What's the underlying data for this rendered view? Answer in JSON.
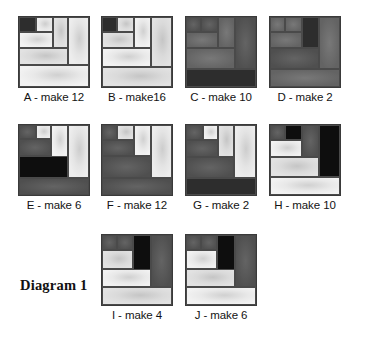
{
  "figure": {
    "title": "Diagram 1",
    "type": "quilt-block-diagram",
    "block_count": 10
  },
  "palette": {
    "very_dark": "#2d2d2d",
    "black": "#0e0e0e",
    "dark_gray": "#585858",
    "medium_gray": "#6e6e6e",
    "light_gray": "#e2e2e2",
    "pale_gray": "#ededed",
    "white_gray": "#f2f2f2",
    "outline": "#3a3a3a"
  },
  "blocks": [
    {
      "id": "A",
      "label": "A - make 12",
      "letter": "A",
      "make": 12,
      "patches": [
        {
          "name": "top-left-square",
          "x": 0,
          "y": 0,
          "w": 24,
          "h": 22,
          "tone": "very_dark"
        },
        {
          "name": "top-mid-square",
          "x": 24,
          "y": 0,
          "w": 24,
          "h": 22,
          "tone": "pale_gray"
        },
        {
          "name": "upper-mid-left-rect",
          "x": 0,
          "y": 22,
          "w": 48,
          "h": 22,
          "tone": "white_gray"
        },
        {
          "name": "tall-center-strip",
          "x": 48,
          "y": 0,
          "w": 22,
          "h": 44,
          "tone": "light_gray"
        },
        {
          "name": "right-tall-strip",
          "x": 70,
          "y": 0,
          "w": 30,
          "h": 68,
          "tone": "pale_gray"
        },
        {
          "name": "mid-wide-bar",
          "x": 0,
          "y": 44,
          "w": 70,
          "h": 24,
          "tone": "light_gray"
        },
        {
          "name": "bottom-full-bar",
          "x": 0,
          "y": 68,
          "w": 100,
          "h": 32,
          "tone": "white_gray"
        }
      ]
    },
    {
      "id": "B",
      "label": "B - make16",
      "letter": "B",
      "make": 16,
      "patches": [
        {
          "name": "top-left-square",
          "x": 0,
          "y": 0,
          "w": 22,
          "h": 22,
          "tone": "very_dark"
        },
        {
          "name": "top-mid-square",
          "x": 22,
          "y": 0,
          "w": 24,
          "h": 22,
          "tone": "light_gray"
        },
        {
          "name": "upper-left-bar",
          "x": 0,
          "y": 22,
          "w": 46,
          "h": 22,
          "tone": "light_gray"
        },
        {
          "name": "center-strip",
          "x": 46,
          "y": 0,
          "w": 24,
          "h": 44,
          "tone": "white_gray"
        },
        {
          "name": "right-tall-strip",
          "x": 70,
          "y": 0,
          "w": 30,
          "h": 72,
          "tone": "light_gray"
        },
        {
          "name": "mid-wide-bar",
          "x": 0,
          "y": 44,
          "w": 70,
          "h": 28,
          "tone": "white_gray"
        },
        {
          "name": "bottom-full-bar",
          "x": 0,
          "y": 72,
          "w": 100,
          "h": 28,
          "tone": "light_gray"
        }
      ]
    },
    {
      "id": "C",
      "label": "C - make 10",
      "letter": "C",
      "make": 10,
      "patches": [
        {
          "name": "top-left-square",
          "x": 0,
          "y": 0,
          "w": 22,
          "h": 22,
          "tone": "dark_gray"
        },
        {
          "name": "top-mid-square",
          "x": 22,
          "y": 0,
          "w": 24,
          "h": 22,
          "tone": "dark_gray"
        },
        {
          "name": "upper-left-bar",
          "x": 0,
          "y": 22,
          "w": 46,
          "h": 22,
          "tone": "medium_gray"
        },
        {
          "name": "center-strip",
          "x": 46,
          "y": 0,
          "w": 24,
          "h": 44,
          "tone": "medium_gray"
        },
        {
          "name": "right-tall-strip",
          "x": 70,
          "y": 0,
          "w": 30,
          "h": 74,
          "tone": "dark_gray"
        },
        {
          "name": "mid-wide-bar",
          "x": 0,
          "y": 44,
          "w": 70,
          "h": 30,
          "tone": "medium_gray"
        },
        {
          "name": "bottom-full-bar",
          "x": 0,
          "y": 74,
          "w": 100,
          "h": 26,
          "tone": "very_dark"
        }
      ]
    },
    {
      "id": "D",
      "label": "D - make 2",
      "letter": "D",
      "make": 2,
      "patches": [
        {
          "name": "top-left-square",
          "x": 0,
          "y": 0,
          "w": 22,
          "h": 22,
          "tone": "medium_gray"
        },
        {
          "name": "top-mid-square",
          "x": 22,
          "y": 0,
          "w": 24,
          "h": 22,
          "tone": "medium_gray"
        },
        {
          "name": "upper-left-bar",
          "x": 0,
          "y": 22,
          "w": 46,
          "h": 22,
          "tone": "medium_gray"
        },
        {
          "name": "center-dark-strip",
          "x": 46,
          "y": 0,
          "w": 24,
          "h": 44,
          "tone": "very_dark"
        },
        {
          "name": "right-tall-strip",
          "x": 70,
          "y": 0,
          "w": 30,
          "h": 74,
          "tone": "medium_gray"
        },
        {
          "name": "mid-wide-bar",
          "x": 0,
          "y": 44,
          "w": 70,
          "h": 30,
          "tone": "dark_gray"
        },
        {
          "name": "bottom-full-bar",
          "x": 0,
          "y": 74,
          "w": 100,
          "h": 26,
          "tone": "medium_gray"
        }
      ]
    },
    {
      "id": "E",
      "label": "E - make 6",
      "letter": "E",
      "make": 6,
      "patches": [
        {
          "name": "top-left-square",
          "x": 0,
          "y": 0,
          "w": 24,
          "h": 20,
          "tone": "dark_gray"
        },
        {
          "name": "top-mid-square",
          "x": 24,
          "y": 0,
          "w": 22,
          "h": 20,
          "tone": "pale_gray"
        },
        {
          "name": "upper-left-bar",
          "x": 0,
          "y": 20,
          "w": 46,
          "h": 24,
          "tone": "dark_gray"
        },
        {
          "name": "center-light-strip",
          "x": 46,
          "y": 0,
          "w": 24,
          "h": 46,
          "tone": "white_gray"
        },
        {
          "name": "right-tall-strip",
          "x": 70,
          "y": 0,
          "w": 30,
          "h": 76,
          "tone": "pale_gray"
        },
        {
          "name": "mid-black-bar",
          "x": 0,
          "y": 44,
          "w": 70,
          "h": 32,
          "tone": "black"
        },
        {
          "name": "bottom-full-bar",
          "x": 0,
          "y": 76,
          "w": 100,
          "h": 24,
          "tone": "dark_gray"
        }
      ]
    },
    {
      "id": "F",
      "label": "F - make 12",
      "letter": "F",
      "make": 12,
      "patches": [
        {
          "name": "top-left-square",
          "x": 0,
          "y": 0,
          "w": 22,
          "h": 22,
          "tone": "dark_gray"
        },
        {
          "name": "top-mid-square",
          "x": 22,
          "y": 0,
          "w": 24,
          "h": 22,
          "tone": "light_gray"
        },
        {
          "name": "upper-left-bar",
          "x": 0,
          "y": 22,
          "w": 46,
          "h": 22,
          "tone": "dark_gray"
        },
        {
          "name": "center-light-strip",
          "x": 46,
          "y": 0,
          "w": 24,
          "h": 44,
          "tone": "white_gray"
        },
        {
          "name": "right-tall-strip",
          "x": 70,
          "y": 0,
          "w": 30,
          "h": 76,
          "tone": "pale_gray"
        },
        {
          "name": "mid-dark-bar",
          "x": 0,
          "y": 44,
          "w": 70,
          "h": 32,
          "tone": "dark_gray"
        },
        {
          "name": "bottom-full-bar",
          "x": 0,
          "y": 76,
          "w": 100,
          "h": 24,
          "tone": "dark_gray"
        }
      ]
    },
    {
      "id": "G",
      "label": "G - make 2",
      "letter": "G",
      "make": 2,
      "patches": [
        {
          "name": "top-left-square",
          "x": 0,
          "y": 0,
          "w": 24,
          "h": 22,
          "tone": "dark_gray"
        },
        {
          "name": "top-mid-square",
          "x": 24,
          "y": 0,
          "w": 22,
          "h": 22,
          "tone": "white_gray"
        },
        {
          "name": "upper-left-bar",
          "x": 0,
          "y": 22,
          "w": 46,
          "h": 24,
          "tone": "dark_gray"
        },
        {
          "name": "center-light-strip",
          "x": 46,
          "y": 0,
          "w": 22,
          "h": 46,
          "tone": "light_gray"
        },
        {
          "name": "right-tall-strip",
          "x": 68,
          "y": 0,
          "w": 32,
          "h": 76,
          "tone": "pale_gray"
        },
        {
          "name": "mid-dark-bar",
          "x": 0,
          "y": 46,
          "w": 68,
          "h": 30,
          "tone": "dark_gray"
        },
        {
          "name": "bottom-full-bar",
          "x": 0,
          "y": 76,
          "w": 100,
          "h": 24,
          "tone": "very_dark"
        }
      ]
    },
    {
      "id": "H",
      "label": "H - make 10",
      "letter": "H",
      "make": 10,
      "patches": [
        {
          "name": "top-left-square",
          "x": 0,
          "y": 0,
          "w": 22,
          "h": 22,
          "tone": "dark_gray"
        },
        {
          "name": "top-black-square",
          "x": 22,
          "y": 0,
          "w": 24,
          "h": 22,
          "tone": "black"
        },
        {
          "name": "center-gray-strip",
          "x": 46,
          "y": 0,
          "w": 24,
          "h": 46,
          "tone": "dark_gray"
        },
        {
          "name": "right-black-strip",
          "x": 70,
          "y": 0,
          "w": 30,
          "h": 74,
          "tone": "black"
        },
        {
          "name": "upper-light-bar",
          "x": 0,
          "y": 22,
          "w": 46,
          "h": 24,
          "tone": "white_gray"
        },
        {
          "name": "mid-light-bar",
          "x": 0,
          "y": 46,
          "w": 70,
          "h": 28,
          "tone": "light_gray"
        },
        {
          "name": "bottom-full-bar",
          "x": 0,
          "y": 74,
          "w": 100,
          "h": 26,
          "tone": "white_gray"
        }
      ]
    },
    {
      "id": "I",
      "label": "I - make 4",
      "letter": "I",
      "make": 4,
      "patches": [
        {
          "name": "top-left-square",
          "x": 0,
          "y": 0,
          "w": 22,
          "h": 22,
          "tone": "dark_gray"
        },
        {
          "name": "top-mid-square",
          "x": 22,
          "y": 0,
          "w": 22,
          "h": 22,
          "tone": "dark_gray"
        },
        {
          "name": "center-black-strip",
          "x": 44,
          "y": 0,
          "w": 26,
          "h": 50,
          "tone": "black"
        },
        {
          "name": "right-gray-strip",
          "x": 70,
          "y": 0,
          "w": 30,
          "h": 74,
          "tone": "dark_gray"
        },
        {
          "name": "upper-light-bar",
          "x": 0,
          "y": 22,
          "w": 44,
          "h": 26,
          "tone": "light_gray"
        },
        {
          "name": "mid-light-bar",
          "x": 0,
          "y": 48,
          "w": 70,
          "h": 26,
          "tone": "white_gray"
        },
        {
          "name": "bottom-full-bar",
          "x": 0,
          "y": 74,
          "w": 100,
          "h": 26,
          "tone": "light_gray"
        }
      ]
    },
    {
      "id": "J",
      "label": "J - make 6",
      "letter": "J",
      "make": 6,
      "patches": [
        {
          "name": "top-left-square",
          "x": 0,
          "y": 0,
          "w": 22,
          "h": 22,
          "tone": "dark_gray"
        },
        {
          "name": "top-mid-square",
          "x": 22,
          "y": 0,
          "w": 22,
          "h": 22,
          "tone": "dark_gray"
        },
        {
          "name": "center-black-strip",
          "x": 44,
          "y": 0,
          "w": 26,
          "h": 50,
          "tone": "black"
        },
        {
          "name": "right-gray-strip",
          "x": 70,
          "y": 0,
          "w": 30,
          "h": 74,
          "tone": "dark_gray"
        },
        {
          "name": "upper-light-bar",
          "x": 0,
          "y": 22,
          "w": 44,
          "h": 26,
          "tone": "white_gray"
        },
        {
          "name": "mid-light-bar",
          "x": 0,
          "y": 48,
          "w": 70,
          "h": 26,
          "tone": "light_gray"
        },
        {
          "name": "bottom-full-bar",
          "x": 0,
          "y": 74,
          "w": 100,
          "h": 26,
          "tone": "white_gray"
        }
      ]
    }
  ],
  "layout": {
    "rows": [
      [
        "A",
        "B",
        "C",
        "D"
      ],
      [
        "E",
        "F",
        "G",
        "H"
      ],
      [
        "I",
        "J"
      ]
    ]
  }
}
